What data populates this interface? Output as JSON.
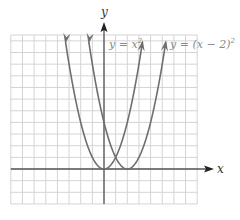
{
  "chart_data": {
    "type": "line",
    "title": "",
    "xlabel": "x",
    "ylabel": "y",
    "xlim": [
      -8,
      8
    ],
    "ylim": [
      -3,
      11.5
    ],
    "grid": true,
    "grid_step": 1,
    "series": [
      {
        "name": "y = x^2",
        "label": "y = x²",
        "formula": "x^2",
        "h": 0,
        "x": [
          -3.3,
          -3,
          -2,
          -1,
          0,
          1,
          2,
          3,
          3.3
        ],
        "values": [
          10.89,
          9,
          4,
          1,
          0,
          1,
          4,
          9,
          10.89
        ]
      },
      {
        "name": "y = (x - 2)^2",
        "label": "y = (x − 2)²",
        "formula": "(x-2)^2",
        "h": 2,
        "x": [
          -1.3,
          -1,
          0,
          1,
          2,
          3,
          4,
          5,
          5.3
        ],
        "values": [
          10.89,
          9,
          4,
          1,
          0,
          1,
          4,
          9,
          10.89
        ]
      }
    ],
    "annotations": [
      {
        "text": "y = x²",
        "near": "right arm of y = x²"
      },
      {
        "text": "y = (x − 2)²",
        "near": "right arm of y = (x − 2)²"
      }
    ]
  },
  "labels": {
    "x_axis": "x",
    "y_axis": "y",
    "curve1": "y = x",
    "curve1_exp": "2",
    "curve2": "y = (x − 2)",
    "curve2_exp": "2"
  },
  "colors": {
    "grid": "#d4d4d4",
    "axis": "#555555",
    "curve": "#6e6e6e",
    "label": "#888888",
    "axis_label": "#333333"
  }
}
